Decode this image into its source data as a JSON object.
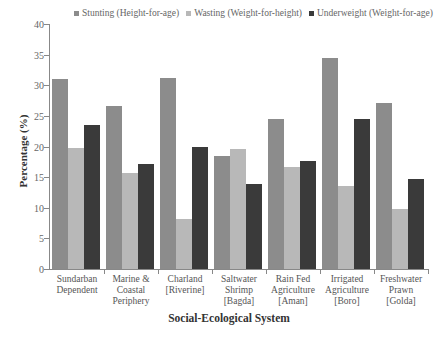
{
  "chart_data": {
    "type": "bar",
    "title": "",
    "xlabel": "Social-Ecological System",
    "ylabel": "Percentage (%)",
    "ylim": [
      0,
      40
    ],
    "yticks": [
      0,
      5,
      10,
      15,
      20,
      25,
      30,
      35,
      40
    ],
    "grid": false,
    "legend_position": "top",
    "categories": [
      "Sundarban Dependent",
      "Marine & Coastal Periphery",
      "Charland [Riverine]",
      "Saltwater Shrimp [Bagda]",
      "Rain Fed Agriculture [Aman]",
      "Irrigated Agriculture [Boro]",
      "Freshwater Prawn [Golda]"
    ],
    "category_lines": [
      [
        "Sundarban",
        "Dependent"
      ],
      [
        "Marine &",
        "Coastal",
        "Periphery"
      ],
      [
        "Charland",
        "[Riverine]"
      ],
      [
        "Saltwater",
        "Shrimp",
        "[Bagda]"
      ],
      [
        "Rain Fed",
        "Agriculture",
        "[Aman]"
      ],
      [
        "Irrigated",
        "Agriculture",
        "[Boro]"
      ],
      [
        "Freshwater",
        "Prawn",
        "[Golda]"
      ]
    ],
    "series": [
      {
        "name": "Stunting (Height-for-age)",
        "color": "#8c8c8c",
        "values": [
          31.0,
          26.6,
          31.2,
          18.4,
          24.5,
          34.5,
          27.1
        ]
      },
      {
        "name": "Wasting (Weight-for-height)",
        "color": "#b8b8b8",
        "values": [
          19.7,
          15.6,
          8.2,
          19.6,
          16.7,
          13.6,
          9.8
        ]
      },
      {
        "name": "Underweight (Weight-for-age)",
        "color": "#3a3a3a",
        "values": [
          23.5,
          17.1,
          19.9,
          13.9,
          17.7,
          24.5,
          14.7
        ]
      }
    ]
  }
}
